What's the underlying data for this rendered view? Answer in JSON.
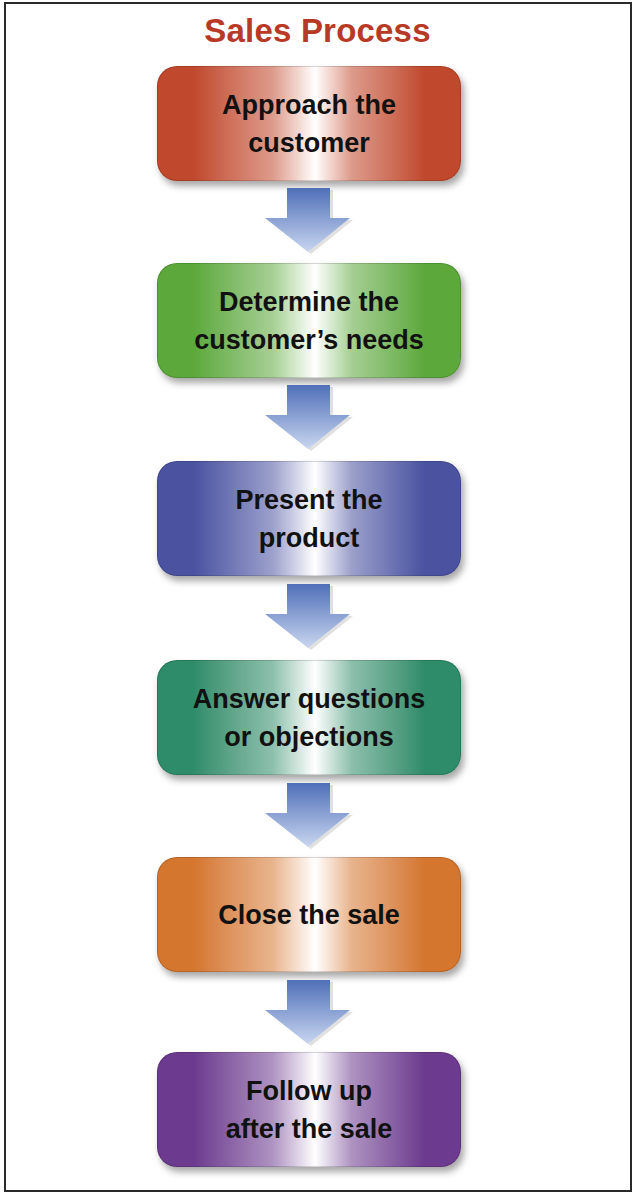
{
  "title": "Sales Process",
  "steps": [
    {
      "label": "Approach the\ncustomer",
      "color": "#c0482c",
      "top": 66
    },
    {
      "label": "Determine the\ncustomer’s needs",
      "color": "#5ca83a",
      "top": 263
    },
    {
      "label": "Present the\nproduct",
      "color": "#4b52a0",
      "top": 461
    },
    {
      "label": "Answer questions\nor objections",
      "color": "#2e8c6a",
      "top": 660
    },
    {
      "label": "Close the sale",
      "color": "#d4762e",
      "top": 857
    },
    {
      "label": "Follow up\nafter the sale",
      "color": "#6c3a8e",
      "top": 1052
    }
  ],
  "arrows": [
    {
      "top": 188
    },
    {
      "top": 385
    },
    {
      "top": 584
    },
    {
      "top": 783
    },
    {
      "top": 980
    }
  ],
  "colors": {
    "title": "#b83a26",
    "arrow_dark": "#4f6fb8",
    "arrow_light": "#c9d6f0",
    "frame": "#2a2a2a"
  }
}
